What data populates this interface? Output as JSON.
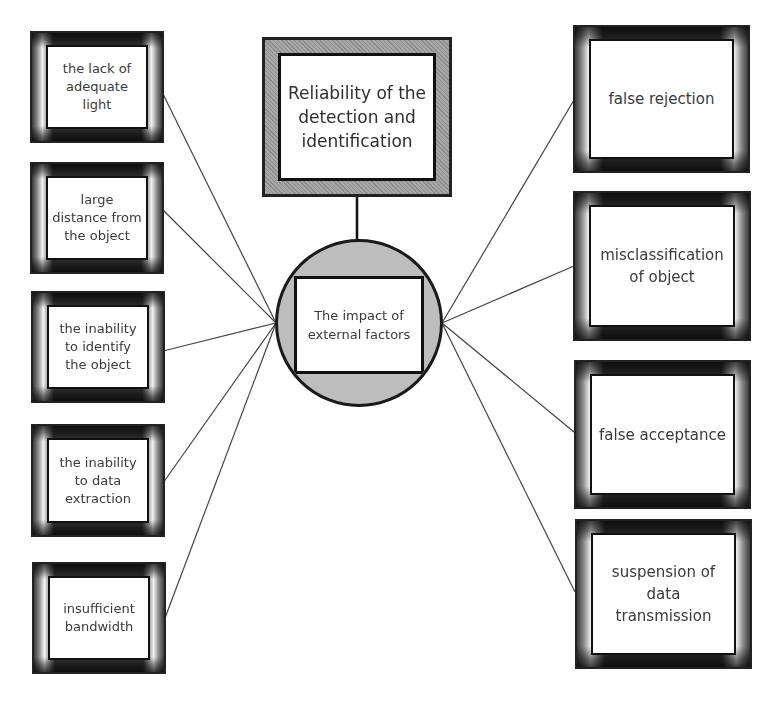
{
  "diagram": {
    "top_node": {
      "label": "Reliability of the detection and identification"
    },
    "hub_node": {
      "label": "The impact of external factors"
    },
    "left_nodes": [
      {
        "label": "the lack of adequate light"
      },
      {
        "label": "large distance from the object"
      },
      {
        "label": "the inability to identify the object"
      },
      {
        "label": "the inability to data extraction"
      },
      {
        "label": "insufficient bandwidth"
      }
    ],
    "right_nodes": [
      {
        "label": "false rejection"
      },
      {
        "label": "misclassification of object"
      },
      {
        "label": "false acceptance"
      },
      {
        "label": "suspension of data transmission"
      }
    ],
    "colors": {
      "frame_dark": "#222222",
      "hub_fill": "#bdbdbd",
      "top_frame": "#9a9a9a",
      "line": "#444444"
    }
  }
}
